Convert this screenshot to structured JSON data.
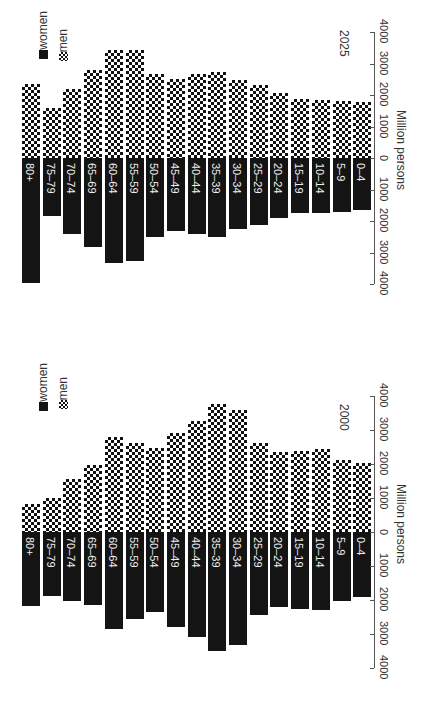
{
  "chart_data": [
    {
      "type": "bar",
      "title": "2025",
      "orientation": "population pyramid (rotated 90°)",
      "xlabel": "Million persons",
      "ylabel": "Age group",
      "xlim": [
        -4000,
        4000
      ],
      "ticks": [
        "4000",
        "3000",
        "2000",
        "1000",
        "0",
        "1000",
        "2000",
        "3000",
        "4000"
      ],
      "legend": [
        "women",
        "men"
      ],
      "categories": [
        "80+",
        "75–79",
        "70–74",
        "65–69",
        "60–64",
        "55–59",
        "50–54",
        "45–49",
        "40–44",
        "35–39",
        "30–34",
        "25–29",
        "20–24",
        "15–19",
        "10–14",
        "5–9",
        "0–4"
      ],
      "series": [
        {
          "name": "women",
          "values": [
            3970,
            1840,
            2410,
            2830,
            3330,
            3270,
            2510,
            2320,
            2410,
            2510,
            2250,
            2130,
            1900,
            1750,
            1750,
            1710,
            1650
          ]
        },
        {
          "name": "men",
          "values": [
            2350,
            1590,
            2190,
            2790,
            3430,
            3430,
            2670,
            2510,
            2670,
            2730,
            2480,
            2320,
            2060,
            1870,
            1840,
            1810,
            1780
          ]
        }
      ]
    },
    {
      "type": "bar",
      "title": "2000",
      "orientation": "population pyramid (rotated 90°)",
      "xlabel": "Million persons",
      "ylabel": "Age group",
      "xlim": [
        -4000,
        4000
      ],
      "ticks": [
        "4000",
        "3000",
        "2000",
        "1000",
        "0",
        "1000",
        "2000",
        "3000",
        "4000"
      ],
      "legend": [
        "women",
        "men"
      ],
      "categories": [
        "80+",
        "75–79",
        "70–74",
        "65–69",
        "60–64",
        "55–59",
        "50–54",
        "45–49",
        "40–44",
        "35–39",
        "30–34",
        "25–29",
        "20–24",
        "15–19",
        "10–14",
        "5–9",
        "0–4"
      ],
      "series": [
        {
          "name": "women",
          "values": [
            2180,
            1880,
            2030,
            2150,
            2850,
            2560,
            2350,
            2790,
            3090,
            3500,
            3320,
            2440,
            2210,
            2260,
            2290,
            2030,
            1910
          ]
        },
        {
          "name": "men",
          "values": [
            820,
            1000,
            1560,
            1970,
            2790,
            2620,
            2470,
            2910,
            3260,
            3760,
            3590,
            2620,
            2350,
            2380,
            2440,
            2120,
            2030
          ]
        }
      ]
    }
  ],
  "legend": {
    "women": "women",
    "men": "men"
  },
  "charts": [
    {
      "year": "2025",
      "axis_title": "Million persons"
    },
    {
      "year": "2000",
      "axis_title": "Million persons"
    }
  ]
}
